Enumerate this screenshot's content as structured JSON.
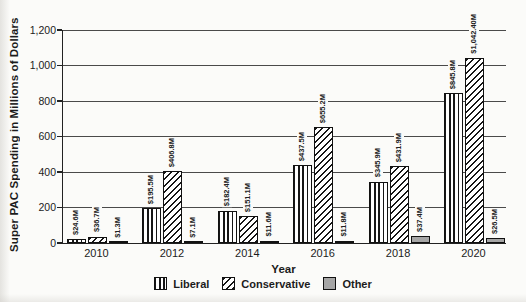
{
  "figure": {
    "background": "#fbfbf9",
    "text_color": "#1c1c1c",
    "bar_border_color": "#111111",
    "gridline_color": "#4a4a4a",
    "other_bar_color": "#a6a6a6"
  },
  "chart_data": {
    "type": "bar",
    "title": "",
    "xlabel": "Year",
    "ylabel": "Super PAC Spending in Millions of Dollars",
    "categories": [
      "2010",
      "2012",
      "2014",
      "2016",
      "2018",
      "2020"
    ],
    "series": [
      {
        "name": "Liberal",
        "pattern": "liberal",
        "pattern_description": "vertical-stripes",
        "values": [
          24.6,
          195.5,
          182.4,
          437.5,
          345.9,
          845.8
        ],
        "labels": [
          "$24.6M",
          "$195.5M",
          "$182.4M",
          "$437.5M",
          "$345.9M",
          "$845.8M"
        ]
      },
      {
        "name": "Conservative",
        "pattern": "conservative",
        "pattern_description": "diagonal-stripes",
        "values": [
          36.7,
          406.8,
          151.1,
          655.2,
          431.9,
          1042.4
        ],
        "labels": [
          "$36.7M",
          "$406.8M",
          "$151.1M",
          "$655.2M",
          "$431.9M",
          "$1,042.40M"
        ]
      },
      {
        "name": "Other",
        "pattern": "other",
        "pattern_description": "solid-gray",
        "values": [
          1.3,
          7.1,
          11.6,
          11.8,
          37.4,
          26.5
        ],
        "labels": [
          "$1.3M",
          "$7.1M",
          "$11.6M",
          "$11.8M",
          "$37.4M",
          "$26.5M"
        ]
      }
    ],
    "ylim": [
      0,
      1200
    ],
    "ytick_interval": 200,
    "ytick_labels": [
      "0",
      "200",
      "400",
      "600",
      "800",
      "1,000",
      "1,200"
    ],
    "grid": "horizontal",
    "legend_position": "bottom"
  }
}
